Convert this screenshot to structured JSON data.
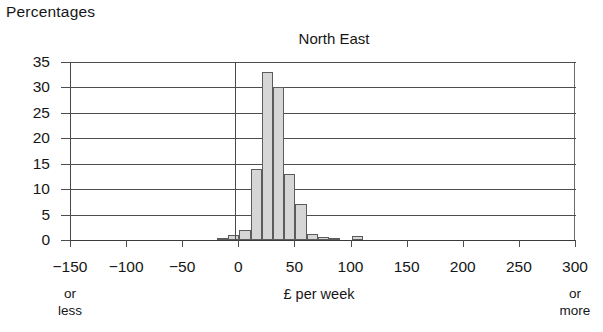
{
  "figure": {
    "y_axis_caption": "Percentages",
    "title": "North East",
    "x_axis_title": "£ per week",
    "left_endpoint_note_line1": "or",
    "left_endpoint_note_line2": "less",
    "right_endpoint_note_line1": "or",
    "right_endpoint_note_line2": "more"
  },
  "colors": {
    "bar_fill": "#d6d6d6",
    "bar_stroke": "#5c5c5c",
    "grid": "#4d4d4d",
    "axis": "#3b3b3b",
    "text": "#161616",
    "background": "#ffffff"
  },
  "chart_data": {
    "type": "bar",
    "title": "North East",
    "subtitle": "",
    "xlabel": "£ per week",
    "ylabel": "Percentages",
    "xlim": [
      -150,
      300
    ],
    "ylim": [
      0,
      35
    ],
    "grid": true,
    "legend": "none",
    "bin_width": 10,
    "x_tick_labels": [
      "−150",
      "−100",
      "−50",
      "0",
      "50",
      "100",
      "150",
      "200",
      "250",
      "300"
    ],
    "x_tick_values": [
      -150,
      -100,
      -50,
      0,
      50,
      100,
      150,
      200,
      250,
      300
    ],
    "y_tick_labels": [
      "0",
      "5",
      "10",
      "15",
      "20",
      "25",
      "30",
      "35"
    ],
    "y_tick_values": [
      0,
      5,
      10,
      15,
      20,
      25,
      30,
      35
    ],
    "categories": [
      "-20 to -10",
      "-10 to 0",
      "0 to 10",
      "10 to 20",
      "20 to 30",
      "30 to 40",
      "40 to 50",
      "50 to 60",
      "60 to 70",
      "70 to 80",
      "80 to 90",
      "100 to 110"
    ],
    "bins_start": [
      -20,
      -10,
      0,
      10,
      20,
      30,
      40,
      50,
      60,
      70,
      80,
      100
    ],
    "values": [
      0.4,
      1.0,
      2.0,
      14.0,
      33.0,
      30.0,
      13.0,
      7.0,
      1.2,
      0.6,
      0.3,
      0.7
    ],
    "annotations": [
      "-150 or less",
      "300 or more"
    ]
  }
}
